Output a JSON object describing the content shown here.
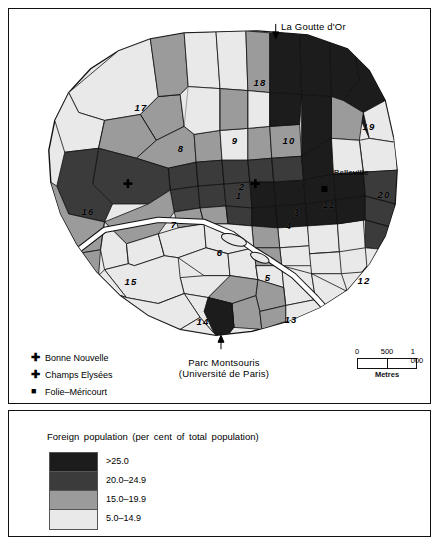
{
  "map": {
    "annotations": [
      {
        "name": "la-goutte-dor",
        "text": "La Goutte d'Or",
        "arrow": "↓"
      },
      {
        "name": "parc-montsouris",
        "line1": "Parc Montsouris",
        "line2": "(Université de Paris)",
        "arrow": "↑"
      }
    ],
    "places": [
      {
        "name": "belleville",
        "label": "Belleville"
      }
    ],
    "arrondissements": [
      {
        "num": "1",
        "class": "15.0-19.9"
      },
      {
        "num": "2",
        "class": ">25.0"
      },
      {
        "num": "3",
        "class": "15.0-19.9"
      },
      {
        "num": "4",
        "class": "5.0-14.9"
      },
      {
        "num": "5",
        "class": "5.0-14.9"
      },
      {
        "num": "6",
        "class": "5.0-14.9"
      },
      {
        "num": "7",
        "class": "15.0-19.9"
      },
      {
        "num": "8",
        "class": "15.0-19.9"
      },
      {
        "num": "9",
        "class": "15.0-19.9"
      },
      {
        "num": "10",
        "class": "20.0-24.9"
      },
      {
        "num": "11",
        "class": "5.0-14.9"
      },
      {
        "num": "12",
        "class": "5.0-14.9"
      },
      {
        "num": "13",
        "class": "15.0-19.9"
      },
      {
        "num": "14",
        "class": "5.0-14.9"
      },
      {
        "num": "15",
        "class": "5.0-14.9"
      },
      {
        "num": "16",
        "class": "15.0-19.9"
      },
      {
        "num": "17",
        "class": "5.0-14.9"
      },
      {
        "num": "18",
        "class": "15.0-19.9"
      },
      {
        "num": "19",
        "class": "15.0-19.9"
      },
      {
        "num": "20",
        "class": "20.0-24.9"
      }
    ],
    "landmark_key": [
      {
        "symbol": "✚",
        "shape": "cross",
        "label": "Bonne Nouvelle"
      },
      {
        "symbol": "✚",
        "shape": "cross",
        "label": "Champs Elysées"
      },
      {
        "symbol": "■",
        "shape": "square",
        "label": "Folie–Méricourt"
      }
    ],
    "scale": {
      "ticks": [
        "0",
        "500",
        "1 000"
      ],
      "caption": "Metres"
    }
  },
  "legend": {
    "title": "Foreign population (per cent of total population)",
    "classes": [
      {
        "label": ">25.0",
        "color": "#1c1c1c"
      },
      {
        "label": "20.0–24.9",
        "color": "#3b3b3b"
      },
      {
        "label": "15.0–19.9",
        "color": "#9b9b9b"
      },
      {
        "label": "5.0–14.9",
        "color": "#e9e9e9"
      }
    ]
  },
  "colors": {
    "class_1": "#1c1c1c",
    "class_2": "#3b3b3b",
    "class_3": "#9b9b9b",
    "class_4": "#e9e9e9",
    "outline": "#111111",
    "river": "#ffffff",
    "frame": "#111111",
    "background": "#ffffff"
  }
}
